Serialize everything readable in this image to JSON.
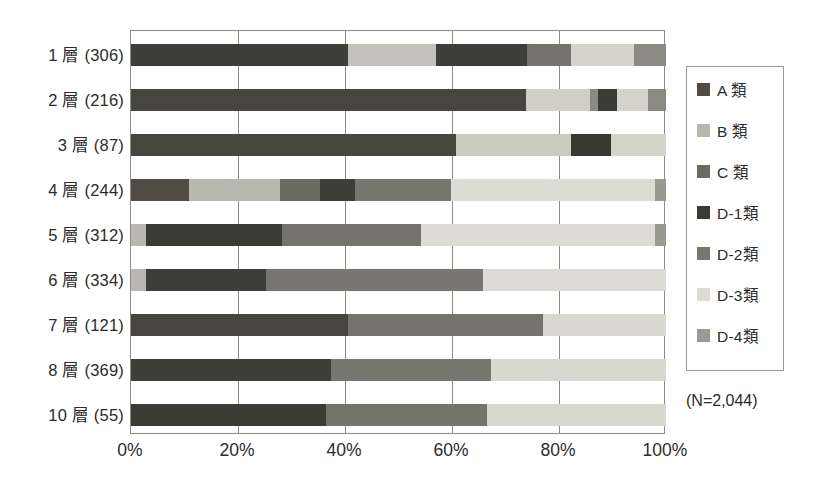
{
  "chart_data": {
    "type": "bar",
    "subtype": "stacked-horizontal-100pct",
    "title": "",
    "xlabel": "",
    "ylabel": "",
    "orientation": "horizontal",
    "stacked": true,
    "normalized": true,
    "grid": true,
    "legend_position": "right",
    "xlim": [
      0,
      100
    ],
    "xticks": [
      0,
      20,
      40,
      60,
      80,
      100
    ],
    "xticklabels": [
      "0%",
      "20%",
      "40%",
      "60%",
      "80%",
      "100%"
    ],
    "categories": [
      "1 層 (306)",
      "2 層 (216)",
      "3 層 (87)",
      "4 層 (244)",
      "5 層 (312)",
      "6 層 (334)",
      "7 層 (121)",
      "8 層 (369)",
      "10 層 (55)"
    ],
    "category_counts": [
      306,
      216,
      87,
      244,
      312,
      334,
      121,
      369,
      55
    ],
    "series": [
      {
        "name": "A 類",
        "color": "#4a4a45",
        "values": [
          0.0,
          0.0,
          0.0,
          10.8,
          2.8,
          2.8,
          0.0,
          0.0,
          0.0
        ]
      },
      {
        "name": "B 類",
        "color": "#b4b4ac",
        "values": [
          0.0,
          0.0,
          0.0,
          17.0,
          0.0,
          0.0,
          0.0,
          0.0,
          0.0
        ]
      },
      {
        "name": "C 類",
        "color": "#7d7d76",
        "values": [
          0.0,
          0.0,
          0.0,
          7.5,
          0.0,
          0.0,
          0.0,
          0.0,
          0.0
        ]
      },
      {
        "name": "D-1類",
        "color": "#3b3b36",
        "values": [
          40.6,
          73.8,
          60.7,
          6.5,
          25.4,
          22.4,
          40.6,
          37.4,
          36.4
        ]
      },
      {
        "name": "D-2類",
        "color": "#6e6e67",
        "values": [
          16.3,
          0.0,
          0.0,
          18.0,
          26.0,
          40.6,
          36.4,
          29.9,
          30.1
        ]
      },
      {
        "name": "D-3類",
        "color": "#d2d2c9",
        "values": [
          0.0,
          12.1,
          21.5,
          38.2,
          43.8,
          34.2,
          23.0,
          32.7,
          33.5
        ]
      },
      {
        "name": "D-4類",
        "color": "#9a9a92",
        "values": [
          43.1,
          14.1,
          17.8,
          2.0,
          2.0,
          0.0,
          0.0,
          0.0,
          0.0
        ]
      }
    ],
    "bars": [
      {
        "category": "1 層 (306)",
        "segments": [
          {
            "series": "D-1類",
            "start": 0.0,
            "end": 40.6,
            "value": 40.6,
            "color": "#3f3f3a"
          },
          {
            "series": "D-3類",
            "start": 40.6,
            "end": 57.0,
            "value": 16.4,
            "color": "#c2c2ba"
          },
          {
            "series": "D-1類",
            "start": 57.0,
            "end": 74.0,
            "value": 17.0,
            "color": "#3f3f3a"
          },
          {
            "series": "D-2類",
            "start": 74.0,
            "end": 82.2,
            "value": 8.2,
            "color": "#74746d"
          },
          {
            "series": "D-3類",
            "start": 82.2,
            "end": 94.0,
            "value": 11.8,
            "color": "#d4d4cb"
          },
          {
            "series": "D-4類",
            "start": 94.0,
            "end": 100.0,
            "value": 6.0,
            "color": "#8a8a83"
          }
        ]
      },
      {
        "category": "2 層 (216)",
        "segments": [
          {
            "series": "D-1類",
            "start": 0.0,
            "end": 73.8,
            "value": 73.8,
            "color": "#46463f"
          },
          {
            "series": "D-3類",
            "start": 73.8,
            "end": 85.8,
            "value": 12.0,
            "color": "#cfcfc6"
          },
          {
            "series": "D-2類",
            "start": 85.8,
            "end": 87.3,
            "value": 1.5,
            "color": "#8a8a83"
          },
          {
            "series": "D-1類",
            "start": 87.3,
            "end": 90.8,
            "value": 3.5,
            "color": "#3b3b36"
          },
          {
            "series": "D-3類",
            "start": 90.8,
            "end": 96.6,
            "value": 5.8,
            "color": "#d4d4cb"
          },
          {
            "series": "D-4類",
            "start": 96.6,
            "end": 100.0,
            "value": 3.4,
            "color": "#8a8a83"
          }
        ]
      },
      {
        "category": "3 層 (87)",
        "segments": [
          {
            "series": "D-1類",
            "start": 0.0,
            "end": 60.7,
            "value": 60.7,
            "color": "#46463f"
          },
          {
            "series": "D-3類",
            "start": 60.7,
            "end": 82.2,
            "value": 21.5,
            "color": "#cbcbc2"
          },
          {
            "series": "D-1類",
            "start": 82.2,
            "end": 89.7,
            "value": 7.5,
            "color": "#383833"
          },
          {
            "series": "D-3類",
            "start": 89.7,
            "end": 100.0,
            "value": 10.3,
            "color": "#d4d4cb"
          }
        ]
      },
      {
        "category": "4 層 (244)",
        "segments": [
          {
            "series": "A 類",
            "start": 0.0,
            "end": 10.8,
            "value": 10.8,
            "color": "#504b45"
          },
          {
            "series": "B 類",
            "start": 10.8,
            "end": 27.8,
            "value": 17.0,
            "color": "#b8b8b0"
          },
          {
            "series": "C 類",
            "start": 27.8,
            "end": 35.3,
            "value": 7.5,
            "color": "#6b6b64"
          },
          {
            "series": "D-1類",
            "start": 35.3,
            "end": 41.8,
            "value": 6.5,
            "color": "#3f3f3a"
          },
          {
            "series": "D-2類",
            "start": 41.8,
            "end": 59.8,
            "value": 18.0,
            "color": "#77776f"
          },
          {
            "series": "D-3類",
            "start": 59.8,
            "end": 98.0,
            "value": 38.2,
            "color": "#dcdcd4"
          },
          {
            "series": "D-4類",
            "start": 98.0,
            "end": 100.0,
            "value": 2.0,
            "color": "#9a9a92"
          }
        ]
      },
      {
        "category": "5 層 (312)",
        "segments": [
          {
            "series": "B 類",
            "start": 0.0,
            "end": 2.8,
            "value": 2.8,
            "color": "#b8b8b0"
          },
          {
            "series": "D-1類",
            "start": 2.8,
            "end": 28.2,
            "value": 25.4,
            "color": "#3b3b36"
          },
          {
            "series": "D-2類",
            "start": 28.2,
            "end": 54.2,
            "value": 26.0,
            "color": "#74746d"
          },
          {
            "series": "D-3類",
            "start": 54.2,
            "end": 98.0,
            "value": 43.8,
            "color": "#dcdcd4"
          },
          {
            "series": "D-4類",
            "start": 98.0,
            "end": 100.0,
            "value": 2.0,
            "color": "#9a9a92"
          }
        ]
      },
      {
        "category": "6 層 (334)",
        "segments": [
          {
            "series": "B 類",
            "start": 0.0,
            "end": 2.8,
            "value": 2.8,
            "color": "#b8b8b0"
          },
          {
            "series": "D-1類",
            "start": 2.8,
            "end": 25.2,
            "value": 22.4,
            "color": "#3f3f3a"
          },
          {
            "series": "D-2類",
            "start": 25.2,
            "end": 65.8,
            "value": 40.6,
            "color": "#77776f"
          },
          {
            "series": "D-3類",
            "start": 65.8,
            "end": 100.0,
            "value": 34.2,
            "color": "#dcdcd4"
          }
        ]
      },
      {
        "category": "7 層 (121)",
        "segments": [
          {
            "series": "D-1類",
            "start": 0.0,
            "end": 40.6,
            "value": 40.6,
            "color": "#46463f"
          },
          {
            "series": "D-2類",
            "start": 40.6,
            "end": 77.0,
            "value": 36.4,
            "color": "#74746d"
          },
          {
            "series": "D-3類",
            "start": 77.0,
            "end": 100.0,
            "value": 23.0,
            "color": "#d8d8d0"
          }
        ]
      },
      {
        "category": "8 層 (369)",
        "segments": [
          {
            "series": "D-1類",
            "start": 0.0,
            "end": 37.4,
            "value": 37.4,
            "color": "#3f3f3a"
          },
          {
            "series": "D-2類",
            "start": 37.4,
            "end": 67.3,
            "value": 29.9,
            "color": "#77776f"
          },
          {
            "series": "D-3類",
            "start": 67.3,
            "end": 100.0,
            "value": 32.7,
            "color": "#d8d8d0"
          }
        ]
      },
      {
        "category": "10 層 (55)",
        "segments": [
          {
            "series": "D-1類",
            "start": 0.0,
            "end": 36.4,
            "value": 36.4,
            "color": "#3b3b36"
          },
          {
            "series": "D-2類",
            "start": 36.4,
            "end": 66.5,
            "value": 30.1,
            "color": "#74746d"
          },
          {
            "series": "D-3類",
            "start": 66.5,
            "end": 100.0,
            "value": 33.5,
            "color": "#d8d8d0"
          }
        ]
      }
    ],
    "legend": [
      {
        "label": "A 類",
        "color": "#504b45"
      },
      {
        "label": "B 類",
        "color": "#b8b8b0"
      },
      {
        "label": "C 類",
        "color": "#6b6b64"
      },
      {
        "label": "D-1類",
        "color": "#3b3b36"
      },
      {
        "label": "D-2類",
        "color": "#77776f"
      },
      {
        "label": "D-3類",
        "color": "#dcdcd4"
      },
      {
        "label": "D-4類",
        "color": "#9a9a92"
      }
    ],
    "annotations": [
      {
        "name": "total-n",
        "text": "(N=2,044)"
      }
    ],
    "total_n": "(N=2,044)"
  }
}
